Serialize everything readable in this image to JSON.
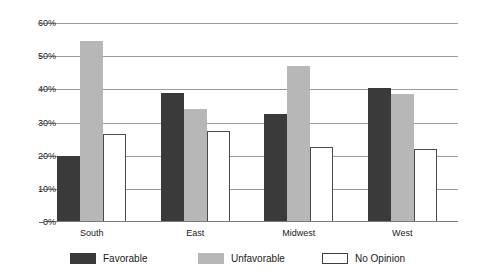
{
  "chart_data": {
    "type": "bar",
    "title": "",
    "subtitle": "",
    "xlabel": "",
    "ylabel": "",
    "categories": [
      "South",
      "East",
      "Midwest",
      "West"
    ],
    "series": [
      {
        "name": "Favorable",
        "color": "#3a3a3a",
        "values": [
          20.0,
          39.0,
          32.5,
          40.5
        ]
      },
      {
        "name": "Unfavorable",
        "color": "#b7b7b7",
        "values": [
          54.5,
          34.0,
          47.0,
          38.5
        ]
      },
      {
        "name": "No Opinion",
        "color": "#ffffff",
        "values": [
          26.5,
          27.5,
          22.5,
          22.0
        ]
      }
    ],
    "ylim": [
      0,
      60
    ],
    "yticks": [
      0,
      10,
      20,
      30,
      40,
      50,
      60
    ],
    "ytick_labels": [
      "0%",
      "10%",
      "20%",
      "30%",
      "40%",
      "50%",
      "60%"
    ],
    "grid": true,
    "legend_position": "bottom",
    "value_suffix": "%"
  },
  "axis": {
    "y_labels": [
      "60%",
      "50%",
      "40%",
      "30%",
      "20%",
      "10%",
      "0%"
    ]
  },
  "legend": {
    "items": [
      {
        "label": "Favorable"
      },
      {
        "label": "Unfavorable"
      },
      {
        "label": "No Opinion"
      }
    ]
  }
}
